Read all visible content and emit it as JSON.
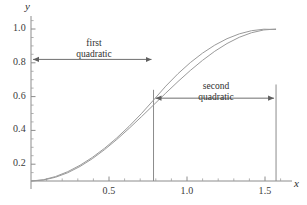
{
  "chart_data": {
    "type": "line",
    "title": "",
    "xlabel": "x",
    "ylabel": "y",
    "xlim": [
      0,
      1.68
    ],
    "ylim": [
      0,
      1.08
    ],
    "grid": false,
    "legend_position": "none",
    "x_ticks_major": [
      0.5,
      1.0,
      1.5
    ],
    "x_tick_labels": [
      "0.5",
      "1.0",
      "1.5"
    ],
    "y_ticks_major": [
      0.2,
      0.4,
      0.6,
      0.8,
      1.0
    ],
    "y_tick_labels": [
      "0.2",
      "0.4",
      "0.6",
      "0.8",
      "1.0"
    ],
    "x_ticks_minor": [
      0.1,
      0.2,
      0.3,
      0.4,
      0.6,
      0.7,
      0.8,
      0.9,
      1.1,
      1.2,
      1.3,
      1.4,
      1.6
    ],
    "y_ticks_minor": [
      0.05,
      0.1,
      0.15,
      0.25,
      0.3,
      0.35,
      0.45,
      0.5,
      0.55,
      0.65,
      0.7,
      0.75,
      0.85,
      0.9,
      0.95,
      1.05
    ],
    "series": [
      {
        "name": "sine curve",
        "color": "#9a9a9a",
        "x": [
          0,
          0.0785,
          0.157,
          0.2356,
          0.3142,
          0.3927,
          0.4712,
          0.5498,
          0.6283,
          0.7069,
          0.7854,
          0.8639,
          0.9425,
          1.021,
          1.0996,
          1.1781,
          1.2566,
          1.3352,
          1.4137,
          1.4923,
          1.5708
        ],
        "y": [
          0,
          0.0062,
          0.0245,
          0.0545,
          0.0955,
          0.1464,
          0.2061,
          0.273,
          0.3455,
          0.4218,
          0.5,
          0.5782,
          0.6545,
          0.727,
          0.7939,
          0.8536,
          0.9045,
          0.9455,
          0.9755,
          0.9938,
          1.0
        ]
      },
      {
        "name": "first quadratic",
        "color": "#9a9a9a",
        "domain": [
          0,
          0.7854
        ],
        "x": [
          0,
          0.0785,
          0.157,
          0.2356,
          0.3142,
          0.3927,
          0.4712,
          0.5498,
          0.6283,
          0.7069,
          0.7854
        ],
        "y": [
          0,
          0.0081,
          0.0293,
          0.0614,
          0.1035,
          0.1549,
          0.215,
          0.2833,
          0.3593,
          0.4424,
          0.5323
        ]
      },
      {
        "name": "second quadratic",
        "color": "#9a9a9a",
        "domain": [
          0.7854,
          1.5708
        ],
        "x": [
          0.7854,
          0.8639,
          0.9425,
          1.021,
          1.0996,
          1.1781,
          1.2566,
          1.3352,
          1.4137,
          1.4923,
          1.5708
        ],
        "y": [
          0.5323,
          0.624,
          0.7062,
          0.7787,
          0.8414,
          0.894,
          0.9363,
          0.968,
          0.9889,
          0.9986,
          0.9969
        ]
      }
    ],
    "reference_lines": [
      {
        "name": "breakpoint-line",
        "x": 0.7854,
        "y_from": 0,
        "y_to": 0.6
      },
      {
        "name": "endpoint-line",
        "x": 1.5708,
        "y_from": 0,
        "y_to": 0.635
      }
    ],
    "annotations": [
      {
        "name": "first-quadratic-span",
        "label_line1": "first",
        "label_line2": "quadratic",
        "x_from": 0.0,
        "x_to": 0.7854,
        "y": 0.8,
        "arrow": "both"
      },
      {
        "name": "second-quadratic-span",
        "label_line1": "second",
        "label_line2": "quadratic",
        "x_from": 0.7854,
        "x_to": 1.5708,
        "y": 0.545,
        "arrow": "both"
      }
    ],
    "colors": {
      "curve": "#9a9a9a",
      "axis": "#8c8c8c",
      "annotation": "#6e6e6e",
      "text": "#2e2e2e"
    }
  },
  "axes": {
    "x_name": "x",
    "y_name": "y"
  },
  "x_tick_labels": {
    "t0": "0.5",
    "t1": "1.0",
    "t2": "1.5"
  },
  "y_tick_labels": {
    "t0": "0.2",
    "t1": "0.4",
    "t2": "0.6",
    "t3": "0.8",
    "t4": "1.0"
  },
  "annotations": {
    "first": {
      "line1": "first",
      "line2": "quadratic"
    },
    "second": {
      "line1": "second",
      "line2": "quadratic"
    }
  }
}
